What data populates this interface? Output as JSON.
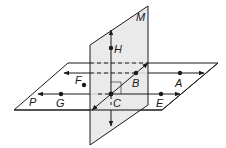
{
  "diagram": {
    "planes": {
      "M": {
        "label": "M",
        "fill": "#e6e6e6"
      },
      "P": {
        "label": "P"
      }
    },
    "points": {
      "H": "H",
      "B": "B",
      "A": "A",
      "F": "F",
      "G": "G",
      "C": "C",
      "E": "E"
    },
    "colors": {
      "stroke": "#1a1a1a",
      "plane_m_fill": "#e6e6e6"
    }
  }
}
